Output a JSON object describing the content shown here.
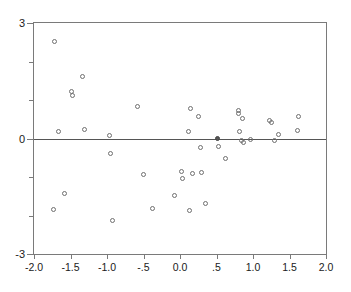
{
  "chart_data": {
    "type": "scatter",
    "title": "",
    "xlabel": "",
    "ylabel": "",
    "xlim": [
      -2.0,
      2.0
    ],
    "ylim": [
      -3,
      3
    ],
    "grid": false,
    "legend": null,
    "xticks": [
      {
        "value": -2.0,
        "label": "-2.0"
      },
      {
        "value": -1.5,
        "label": "-1.5"
      },
      {
        "value": -1.0,
        "label": "-1.0"
      },
      {
        "value": -0.5,
        "label": "-.5"
      },
      {
        "value": 0.0,
        "label": "0.0"
      },
      {
        "value": 0.5,
        "label": ".5"
      },
      {
        "value": 1.0,
        "label": "1.0"
      },
      {
        "value": 1.5,
        "label": "1.5"
      },
      {
        "value": 2.0,
        "label": "2.0"
      }
    ],
    "yticks": [
      {
        "value": 3,
        "label": "3",
        "major": true
      },
      {
        "value": 2,
        "label": "",
        "major": false
      },
      {
        "value": 1,
        "label": "",
        "major": false
      },
      {
        "value": 0,
        "label": "0",
        "major": true
      },
      {
        "value": -1,
        "label": "",
        "major": false
      },
      {
        "value": -2,
        "label": "",
        "major": false
      },
      {
        "value": -3,
        "label": "-3",
        "major": true
      }
    ],
    "reference_lines": [
      {
        "axis": "y",
        "value": 0,
        "color": "#555555"
      }
    ],
    "marker_style": "open-circle",
    "marker_color": "#6f6f6f",
    "points": [
      {
        "x": -1.72,
        "y": 2.52,
        "filled": false
      },
      {
        "x": -1.67,
        "y": 0.18,
        "filled": false
      },
      {
        "x": -1.58,
        "y": -1.42,
        "filled": false
      },
      {
        "x": -1.73,
        "y": -1.85,
        "filled": false
      },
      {
        "x": -1.49,
        "y": 1.23,
        "filled": false
      },
      {
        "x": -1.47,
        "y": 1.12,
        "filled": false
      },
      {
        "x": -1.33,
        "y": 1.62,
        "filled": false
      },
      {
        "x": -1.31,
        "y": 0.24,
        "filled": false
      },
      {
        "x": -0.96,
        "y": 0.09,
        "filled": false
      },
      {
        "x": -0.95,
        "y": -0.39,
        "filled": false
      },
      {
        "x": -0.93,
        "y": -2.13,
        "filled": false
      },
      {
        "x": -0.58,
        "y": 0.84,
        "filled": false
      },
      {
        "x": -0.5,
        "y": -0.94,
        "filled": false
      },
      {
        "x": -0.38,
        "y": -1.83,
        "filled": false
      },
      {
        "x": -0.07,
        "y": -1.48,
        "filled": false
      },
      {
        "x": 0.02,
        "y": -0.87,
        "filled": false
      },
      {
        "x": 0.03,
        "y": -1.03,
        "filled": false
      },
      {
        "x": 0.12,
        "y": 0.18,
        "filled": false
      },
      {
        "x": 0.14,
        "y": 0.78,
        "filled": false
      },
      {
        "x": 0.13,
        "y": -1.86,
        "filled": false
      },
      {
        "x": 0.17,
        "y": -0.92,
        "filled": false
      },
      {
        "x": 0.26,
        "y": 0.56,
        "filled": false
      },
      {
        "x": 0.28,
        "y": -0.23,
        "filled": false
      },
      {
        "x": 0.3,
        "y": -0.88,
        "filled": false
      },
      {
        "x": 0.35,
        "y": -1.7,
        "filled": false
      },
      {
        "x": 0.52,
        "y": 0.0,
        "filled": true
      },
      {
        "x": 0.53,
        "y": -0.21,
        "filled": false
      },
      {
        "x": 0.62,
        "y": -0.52,
        "filled": false
      },
      {
        "x": 0.8,
        "y": 0.72,
        "filled": false
      },
      {
        "x": 0.8,
        "y": 0.66,
        "filled": false
      },
      {
        "x": 0.82,
        "y": 0.19,
        "filled": false
      },
      {
        "x": 0.84,
        "y": -0.06,
        "filled": false
      },
      {
        "x": 0.86,
        "y": 0.52,
        "filled": false
      },
      {
        "x": 0.87,
        "y": -0.1,
        "filled": false
      },
      {
        "x": 0.97,
        "y": -0.03,
        "filled": false
      },
      {
        "x": 1.23,
        "y": 0.46,
        "filled": false
      },
      {
        "x": 1.26,
        "y": 0.42,
        "filled": false
      },
      {
        "x": 1.3,
        "y": -0.06,
        "filled": false
      },
      {
        "x": 1.35,
        "y": 0.1,
        "filled": false
      },
      {
        "x": 1.61,
        "y": 0.21,
        "filled": false
      },
      {
        "x": 1.63,
        "y": 0.58,
        "filled": false
      }
    ]
  }
}
